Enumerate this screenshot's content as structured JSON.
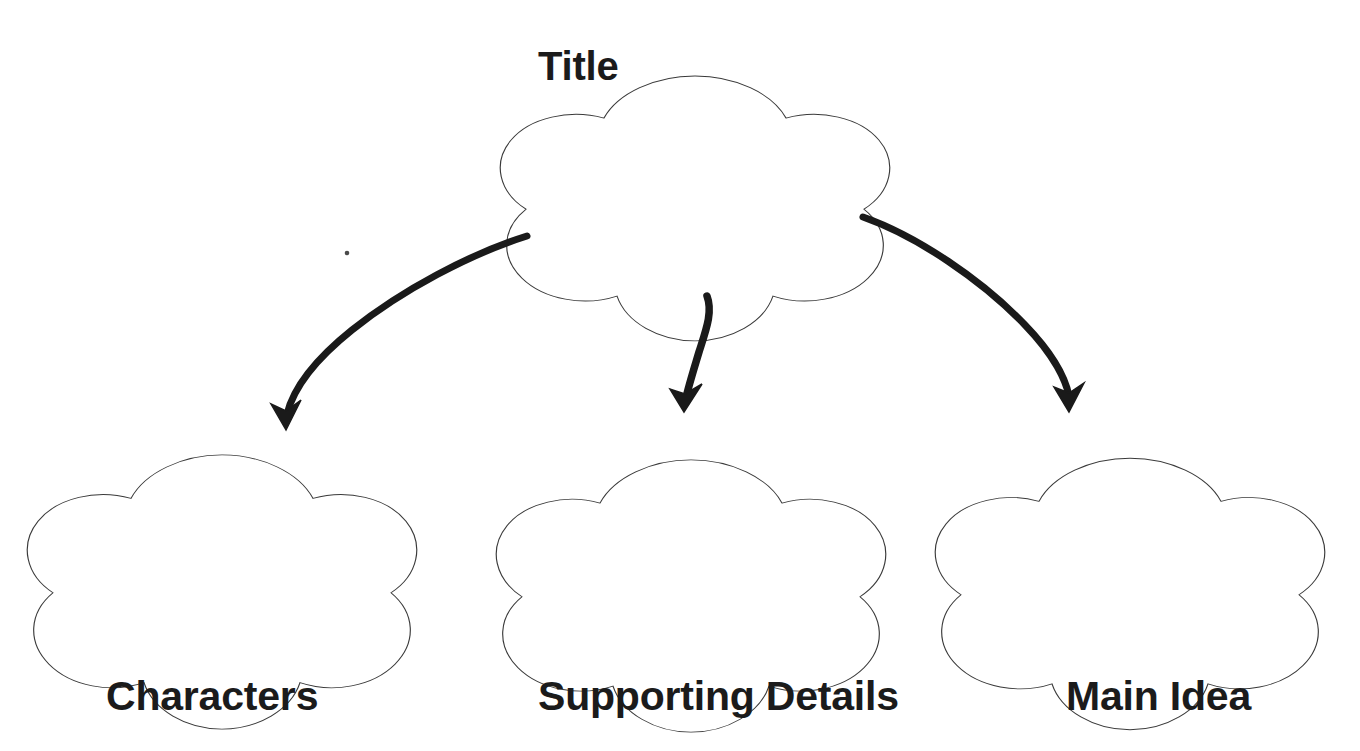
{
  "page": {
    "kind": "graphic-organizer-worksheet",
    "background_color": "#ffffff",
    "width": 1360,
    "height": 751
  },
  "style": {
    "shape_outline_color": "#3a3a3a",
    "arrow_color": "#1a1a1a",
    "text_color": "#1b1b1b"
  },
  "nodes": [
    {
      "id": "title",
      "label": "Title",
      "shape": "five-lobed-flower",
      "label_position": "top-left-outside",
      "center": {
        "x": 695,
        "y": 170
      }
    },
    {
      "id": "characters",
      "label": "Characters",
      "shape": "five-lobed-flower",
      "label_position": "below",
      "center": {
        "x": 222,
        "y": 543
      }
    },
    {
      "id": "supporting-details",
      "label": "Supporting Details",
      "shape": "five-lobed-flower",
      "label_position": "below",
      "center": {
        "x": 691,
        "y": 546
      }
    },
    {
      "id": "main-idea",
      "label": "Main Idea",
      "shape": "five-lobed-flower",
      "label_position": "below",
      "center": {
        "x": 1130,
        "y": 545
      }
    }
  ],
  "connectors": [
    {
      "id": "title-to-characters",
      "from": "title",
      "to": "characters",
      "style": "hand-drawn-curved-arrow",
      "direction": "down-left"
    },
    {
      "id": "title-to-supporting-details",
      "from": "title",
      "to": "supporting-details",
      "style": "hand-drawn-curved-arrow",
      "direction": "down"
    },
    {
      "id": "title-to-main-idea",
      "from": "title",
      "to": "main-idea",
      "style": "hand-drawn-curved-arrow",
      "direction": "down-right"
    }
  ],
  "artifacts": [
    {
      "id": "scan-speck",
      "x": 347,
      "y": 253
    }
  ]
}
